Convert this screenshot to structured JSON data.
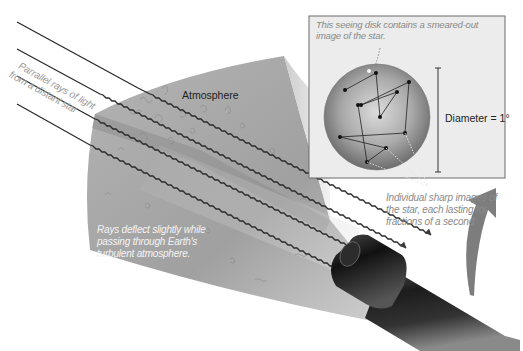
{
  "diagram": {
    "labels": {
      "atmosphere": "Atmosphere",
      "parallel_rays_line1": "Parrallel rays of light",
      "parallel_rays_line2": "from a distant star",
      "deflect_line1": "Rays deflect slightly while",
      "deflect_line2": "passing through Earth's",
      "deflect_line3": "turbulent atmosphere.",
      "seeing_disk_line1": "This seeing disk contains a smeared-out",
      "seeing_disk_line2": "image of the star.",
      "diameter": "Diameter = 1°",
      "individual_line1": "Individual sharp images of",
      "individual_line2": "the star, each lasting for",
      "individual_line3": "fractions of a second"
    },
    "colors": {
      "background": "#ffffff",
      "atmosphere_dark": "#8f8f8f",
      "atmosphere_light": "#c9c9c9",
      "ray": "#2a2a2a",
      "inset_border": "#6a6a6a",
      "inset_bg": "#ececec",
      "disk_edge": "#6e6e6e",
      "disk_center": "#d6d6d6",
      "telescope": "#1a1a1a",
      "curved_arrow": "#7a7a7a",
      "caption_gray": "#8a8a8a"
    },
    "elements": {
      "rays_count": 4,
      "image_points_count": 12,
      "has_telescope": true,
      "has_inset": true,
      "has_curved_arrow": true
    }
  }
}
